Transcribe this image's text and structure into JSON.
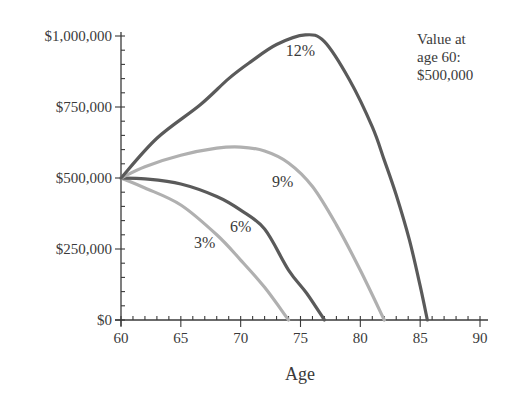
{
  "chart_data": {
    "type": "line",
    "title": "",
    "xlabel": "Age",
    "ylabel": "",
    "xlim": [
      60,
      90
    ],
    "ylim": [
      0,
      1000000
    ],
    "x_ticks": [
      60,
      65,
      70,
      75,
      80,
      85,
      90
    ],
    "x_tick_labels": [
      "60",
      "65",
      "70",
      "75",
      "80",
      "85",
      "90"
    ],
    "y_ticks": [
      0,
      250000,
      500000,
      750000,
      1000000
    ],
    "y_tick_labels": [
      "$0",
      "$250,000",
      "$500,000",
      "$750,000",
      "$1,000,000"
    ],
    "grid": false,
    "legend": "none (series labeled inline)",
    "annotation": [
      "Value at",
      "age 60:",
      "$500,000"
    ],
    "series": [
      {
        "name": "3%",
        "color": "#b0b0b0",
        "label_pos": [
          67.0,
          255000
        ],
        "points": [
          [
            60,
            500000
          ],
          [
            62,
            465000
          ],
          [
            65,
            405000
          ],
          [
            68,
            300000
          ],
          [
            70,
            211000
          ],
          [
            72,
            115000
          ],
          [
            74,
            0
          ]
        ]
      },
      {
        "name": "6%",
        "color": "#5a5a5a",
        "label_pos": [
          70.0,
          310000
        ],
        "points": [
          [
            60,
            500000
          ],
          [
            62,
            497000
          ],
          [
            65,
            479000
          ],
          [
            68,
            435000
          ],
          [
            70,
            387000
          ],
          [
            72,
            320000
          ],
          [
            74,
            176000
          ],
          [
            75.5,
            95000
          ],
          [
            77,
            0
          ]
        ]
      },
      {
        "name": "9%",
        "color": "#b0b0b0",
        "label_pos": [
          73.5,
          470000
        ],
        "points": [
          [
            60,
            500000
          ],
          [
            62,
            540000
          ],
          [
            65,
            580000
          ],
          [
            68,
            605000
          ],
          [
            70,
            609000
          ],
          [
            72,
            595000
          ],
          [
            74,
            553000
          ],
          [
            76,
            470000
          ],
          [
            78,
            335000
          ],
          [
            80,
            175000
          ],
          [
            82,
            0
          ]
        ]
      },
      {
        "name": "12%",
        "color": "#5a5a5a",
        "label_pos": [
          75.0,
          930000
        ],
        "points": [
          [
            60,
            500000
          ],
          [
            63,
            640000
          ],
          [
            66.6,
            757000
          ],
          [
            69,
            850000
          ],
          [
            70.8,
            908000
          ],
          [
            73,
            970000
          ],
          [
            75.4,
            1004000
          ],
          [
            77,
            980000
          ],
          [
            79.1,
            845000
          ],
          [
            81,
            680000
          ],
          [
            82,
            563000
          ],
          [
            83,
            440000
          ],
          [
            84.1,
            282000
          ],
          [
            85,
            120000
          ],
          [
            85.6,
            0
          ]
        ]
      }
    ]
  }
}
